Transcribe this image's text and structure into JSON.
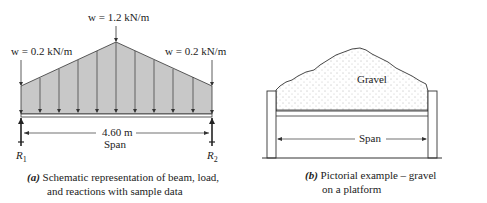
{
  "panel_a": {
    "load_center": "w = 1.2 kN/m",
    "load_left": "w = 0.2 kN/m",
    "load_right": "w = 0.2 kN/m",
    "span_length": "4.60 m",
    "span_label": "Span",
    "reaction_left": "R",
    "reaction_left_sub": "1",
    "reaction_right": "R",
    "reaction_right_sub": "2",
    "caption_letter": "(a)",
    "caption_line1": " Schematic representation of beam, load,",
    "caption_line2": "and reactions with sample data",
    "colors": {
      "load_fill": "#c8c8c8",
      "line": "#333333"
    }
  },
  "panel_b": {
    "material_label": "Gravel",
    "span_label": "Span",
    "caption_letter": "(b)",
    "caption_line1": " Pictorial example – gravel",
    "caption_line2": "on a platform"
  }
}
